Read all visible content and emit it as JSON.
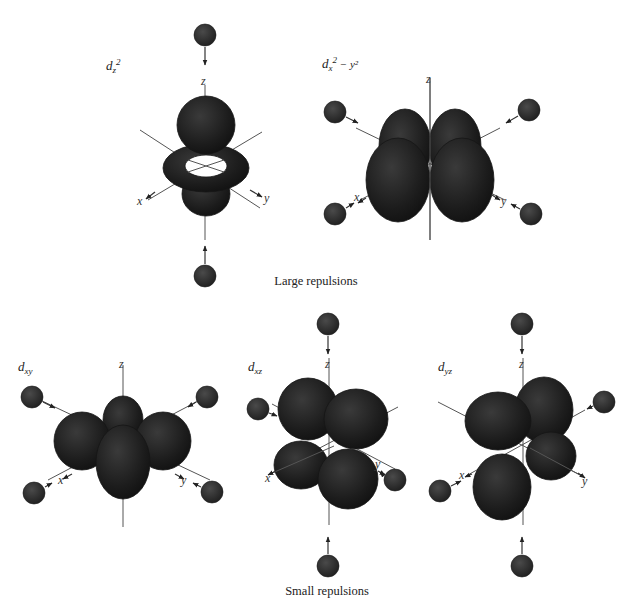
{
  "figure": {
    "captions": {
      "top": "Large repulsions",
      "bottom": "Small repulsions"
    },
    "axis_names": {
      "x": "x",
      "y": "y",
      "z": "z"
    },
    "orbitals": [
      {
        "id": "dz2",
        "symbol": "d",
        "subscript": "z",
        "superscript": "2",
        "extra": "",
        "group": "Large repulsions",
        "ligands_pointing_at_lobes": 6
      },
      {
        "id": "dx2-y2",
        "symbol": "d",
        "subscript": "x",
        "superscript": "2",
        "extra": " − y²",
        "group": "Large repulsions",
        "ligands_pointing_at_lobes": 4
      },
      {
        "id": "dxy",
        "symbol": "d",
        "subscript": "xy",
        "superscript": "",
        "extra": "",
        "group": "Small repulsions",
        "ligands_pointing_at_lobes": 0
      },
      {
        "id": "dxz",
        "symbol": "d",
        "subscript": "xz",
        "superscript": "",
        "extra": "",
        "group": "Small repulsions",
        "ligands_pointing_at_lobes": 0
      },
      {
        "id": "dyz",
        "symbol": "d",
        "subscript": "yz",
        "superscript": "",
        "extra": "",
        "group": "Small repulsions",
        "ligands_pointing_at_lobes": 0
      }
    ],
    "colors": {
      "lobe": "#1c1c1c",
      "ligand": "#2a2a2a",
      "axis": "#555555",
      "background": "#ffffff"
    }
  }
}
